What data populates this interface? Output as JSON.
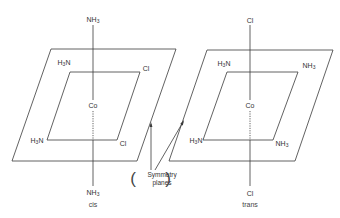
{
  "diagram": {
    "type": "octahedral-complex-isomers",
    "colors": {
      "line": "#3a3a3a",
      "text": "#333333",
      "background": "#ffffff"
    },
    "cis": {
      "caption": "cis",
      "center": "Co",
      "top": {
        "main": "NH",
        "sub": "3"
      },
      "bottom": {
        "main": "NH",
        "sub": "3"
      },
      "inner_top_left": {
        "pre_main": "H",
        "pre_sub": "3",
        "post": "N"
      },
      "inner_top_right": "Cl",
      "inner_bottom_left": {
        "pre_main": "H",
        "pre_sub": "3",
        "post": "N"
      },
      "inner_bottom_right": "Cl"
    },
    "trans": {
      "caption": "trans",
      "center": "Co",
      "top": "Cl",
      "bottom": "Cl",
      "inner_top_left": {
        "pre_main": "H",
        "pre_sub": "3",
        "post": "N"
      },
      "inner_top_right": {
        "main": "NH",
        "sub": "3"
      },
      "inner_bottom_left": {
        "pre_main": "H",
        "pre_sub": "3",
        "post": "N"
      },
      "inner_bottom_right": {
        "main": "NH",
        "sub": "3"
      }
    },
    "annotation": {
      "line1": "Symmetry",
      "line2": "planes",
      "open_paren": "(",
      "close_paren": ")"
    }
  }
}
